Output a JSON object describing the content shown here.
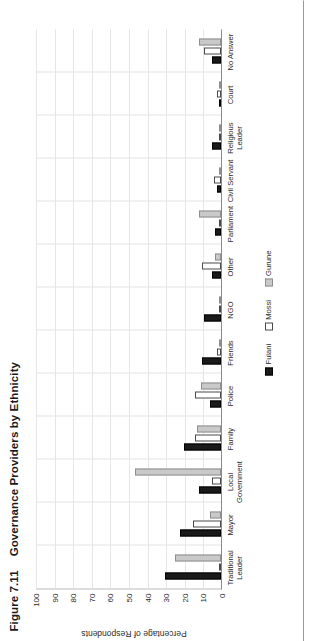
{
  "figure": {
    "number": "Figure 7.11",
    "title": "Governance Providers by Ethnicity"
  },
  "axis": {
    "y_label": "Percentage of Respondents",
    "y_ticks": [
      "0",
      "10",
      "20",
      "30",
      "40",
      "50",
      "60",
      "70",
      "80",
      "90",
      "100"
    ]
  },
  "legend": {
    "position": "bottom-center",
    "items": [
      {
        "label": "Fulani",
        "color": "#1a1a1a"
      },
      {
        "label": "Mossi",
        "color": "#ffffff"
      },
      {
        "label": "Gurune",
        "color": "#c9c9c9"
      }
    ]
  },
  "chart_data": {
    "type": "bar",
    "title": "Governance Providers by Ethnicity",
    "xlabel": "",
    "ylabel": "Percentage of Respondents",
    "ylim": [
      0,
      100
    ],
    "grid": true,
    "categories": [
      "Traditional\nLeader",
      "Mayor",
      "Local\nGovernment",
      "Family",
      "Police",
      "Friends",
      "NGO",
      "Other",
      "Parliament",
      "Civil Servant",
      "Religious\nLeader",
      "Court",
      "No Answer"
    ],
    "series": [
      {
        "name": "Fulani",
        "values": [
          30,
          22,
          12,
          20,
          6,
          10,
          9,
          5,
          3,
          2,
          5,
          0,
          5
        ]
      },
      {
        "name": "Mossi",
        "values": [
          0,
          15,
          5,
          14,
          14,
          2,
          1,
          10,
          1,
          4,
          0,
          2,
          9
        ]
      },
      {
        "name": "Gurune",
        "values": [
          25,
          6,
          46,
          13,
          11,
          1,
          0,
          3,
          12,
          0,
          0,
          0,
          12
        ]
      }
    ]
  }
}
